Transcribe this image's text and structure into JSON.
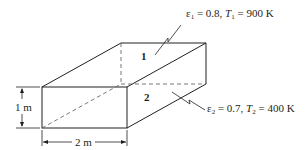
{
  "diagram": {
    "surface1": {
      "number": "1",
      "label_eps": "ε",
      "label_eps_sub": "1",
      "label_eps_value": " = 0.8, ",
      "label_T": "T",
      "label_T_sub": "1",
      "label_T_value": " = 900 K"
    },
    "surface2": {
      "number": "2",
      "label_eps": "ε",
      "label_eps_sub": "2",
      "label_eps_value": " = 0.7, ",
      "label_T": "T",
      "label_T_sub": "2",
      "label_T_value": " = 400 K"
    },
    "dimensions": {
      "height": "1 m",
      "width": "2 m"
    },
    "colors": {
      "line": "#231f20",
      "dashed": "#555555"
    }
  }
}
